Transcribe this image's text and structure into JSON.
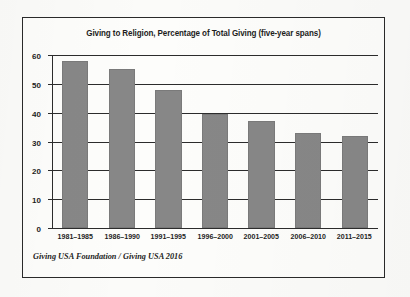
{
  "chart_data": {
    "type": "bar",
    "title": "Giving to Religion, Percentage of Total Giving (five-year spans)",
    "xlabel": "",
    "ylabel": "",
    "categories": [
      "1981–1985",
      "1986–1990",
      "1991–1995",
      "1996–2000",
      "2001–2005",
      "2006–2010",
      "2011–2015"
    ],
    "values": [
      58,
      55,
      48,
      39.6,
      37,
      33,
      31.8
    ],
    "ylim": [
      0,
      60
    ],
    "yticks": [
      0,
      10,
      20,
      30,
      40,
      50,
      60
    ],
    "ytick_labels": [
      "0",
      "10",
      "20",
      "30",
      "40",
      "50",
      "60"
    ],
    "grid": true,
    "legend": null,
    "bar_color": "#878787",
    "axis_color": "#2c2c2c",
    "text_color": "#1d1d1d"
  },
  "source": {
    "caption": "Giving USA Foundation / Giving USA 2016"
  }
}
